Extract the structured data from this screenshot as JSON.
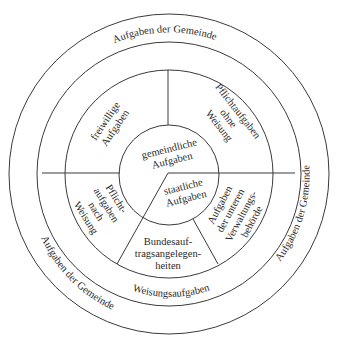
{
  "diagram": {
    "type": "concentric-circle-diagram",
    "center": {
      "x": 169,
      "y": 174
    },
    "rings": {
      "outer_label": "Aufgaben der Gemeinde",
      "outer_label_positions": [
        "top",
        "right",
        "bottom-left"
      ],
      "weisung_ring_label": "Weisungsaufgaben"
    },
    "core": {
      "upper": {
        "line1": "gemeindliche",
        "line2": "Aufgaben"
      },
      "lower": {
        "line1": "staatliche",
        "line2": "Aufgaben"
      }
    },
    "sectors": {
      "top_left": {
        "line1": "freiwillige",
        "line2": "Aufgaben"
      },
      "top_right": {
        "line1": "Pflichtaufgaben",
        "line2": "ohne",
        "line3": "Weisung"
      },
      "bottom_left": {
        "line1": "Pflicht-",
        "line2": "aufgaben",
        "line3": "nach",
        "line4": "Weisung"
      },
      "bottom_center": {
        "line1": "Bundesauf-",
        "line2": "tragsangelegen-",
        "line3": "heiten"
      },
      "bottom_right": {
        "line1": "Aufgaben",
        "line2": "der unteren",
        "line3": "Verwaltungs-",
        "line4": "behörde"
      }
    },
    "labels": {
      "outer_top": "Aufgaben der Gemeinde",
      "outer_right": "Aufgaben der Gemeinde",
      "outer_bottom_left": "Aufgaben der Gemeinde",
      "weisung": "Weisungsaufgaben"
    }
  }
}
